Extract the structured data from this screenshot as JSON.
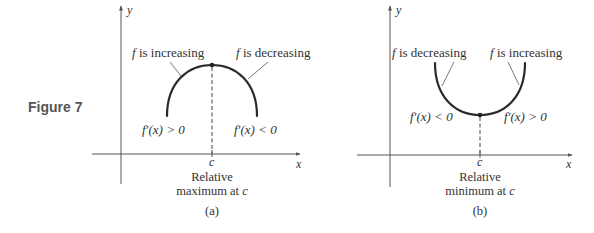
{
  "figure": {
    "label": "Figure 7"
  },
  "panels": [
    {
      "id": "a",
      "caption": "(a)",
      "axis_y_label": "y",
      "axis_x_label": "x",
      "point_label": "c",
      "left_annotation": "f is increasing",
      "left_annotation_f": "f",
      "left_annotation_rest": " is increasing",
      "right_annotation_f": "f",
      "right_annotation_rest": " is decreasing",
      "left_derivative": "f′(x) > 0",
      "right_derivative": "f′(x) < 0",
      "description_line1": "Relative",
      "description_line2_prefix": "maximum at ",
      "description_line2_var": "c"
    },
    {
      "id": "b",
      "caption": "(b)",
      "axis_y_label": "y",
      "axis_x_label": "x",
      "point_label": "c",
      "left_annotation_f": "f",
      "left_annotation_rest": " is decreasing",
      "right_annotation_f": "f",
      "right_annotation_rest": " is increasing",
      "left_derivative": "f′(x) < 0",
      "right_derivative": "f′(x) > 0",
      "description_line1": "Relative",
      "description_line2_prefix": "minimum at ",
      "description_line2_var": "c"
    }
  ],
  "colors": {
    "curve": "#2a2a2a",
    "axis": "#555555",
    "text": "#333333",
    "figure_label": "#555555"
  }
}
